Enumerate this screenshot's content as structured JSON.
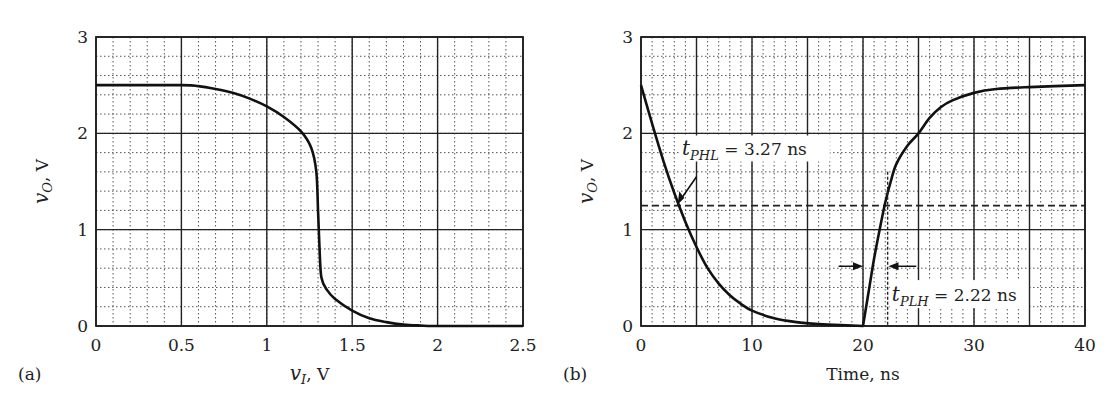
{
  "chart_data": [
    {
      "panel": "(a)",
      "type": "line",
      "title": "",
      "xlabel": "v_I, V",
      "xlabel_var": "v",
      "xlabel_sub": "I",
      "xlabel_unit": ", V",
      "ylabel": "v_O, V",
      "ylabel_var": "v",
      "ylabel_sub": "O",
      "ylabel_unit": ", V",
      "xlim": [
        0,
        2.5
      ],
      "ylim": [
        0,
        3
      ],
      "xticks": [
        "0",
        "0.5",
        "1",
        "1.5",
        "2",
        "2.5"
      ],
      "yticks": [
        "0",
        "1",
        "2",
        "3"
      ],
      "grid": true,
      "series": [
        {
          "name": "VTC",
          "x": [
            0,
            0.5,
            0.6,
            0.7,
            0.8,
            0.9,
            1.0,
            1.1,
            1.2,
            1.26,
            1.29,
            1.3,
            1.31,
            1.32,
            1.35,
            1.4,
            1.5,
            1.6,
            1.7,
            1.8,
            1.9,
            2.0,
            2.5
          ],
          "y": [
            2.5,
            2.5,
            2.49,
            2.46,
            2.42,
            2.36,
            2.28,
            2.17,
            2.02,
            1.85,
            1.6,
            1.2,
            0.75,
            0.5,
            0.38,
            0.28,
            0.16,
            0.08,
            0.04,
            0.015,
            0.005,
            0,
            0
          ]
        }
      ]
    },
    {
      "panel": "(b)",
      "type": "line",
      "title": "",
      "xlabel": "Time, ns",
      "ylabel": "v_O, V",
      "ylabel_var": "v",
      "ylabel_sub": "O",
      "ylabel_unit": ", V",
      "xlim": [
        0,
        40
      ],
      "ylim": [
        0,
        3
      ],
      "xticks": [
        "0",
        "10",
        "20",
        "30",
        "40"
      ],
      "yticks": [
        "0",
        "1",
        "2",
        "3"
      ],
      "grid": true,
      "reference_line": {
        "y": 1.25,
        "style": "dashed"
      },
      "annotations": [
        {
          "text": "t_PHL = 3.27 ns",
          "var": "t",
          "sub": "PHL",
          "rest": " = 3.27 ns",
          "x": 3.27,
          "y": 1.25
        },
        {
          "text": "t_PLH = 2.22 ns",
          "var": "t",
          "sub": "PLH",
          "rest": " = 2.22 ns",
          "x": 22.22,
          "y": 1.25
        }
      ],
      "series": [
        {
          "name": "output",
          "x": [
            0,
            1,
            2,
            3,
            4,
            5,
            6,
            7,
            8,
            9,
            10,
            12,
            14,
            16,
            18,
            20,
            20.5,
            21,
            21.5,
            22,
            22.5,
            23,
            24,
            25,
            26,
            27,
            28,
            30,
            32,
            35,
            40
          ],
          "y": [
            2.5,
            2.1,
            1.72,
            1.38,
            1.08,
            0.82,
            0.6,
            0.44,
            0.32,
            0.23,
            0.16,
            0.08,
            0.04,
            0.02,
            0.01,
            0.0,
            0.35,
            0.7,
            1.0,
            1.28,
            1.5,
            1.68,
            1.87,
            2.0,
            2.16,
            2.27,
            2.34,
            2.42,
            2.46,
            2.48,
            2.5
          ]
        }
      ]
    }
  ],
  "labels": {
    "panel_a": "(a)",
    "panel_b": "(b)"
  }
}
